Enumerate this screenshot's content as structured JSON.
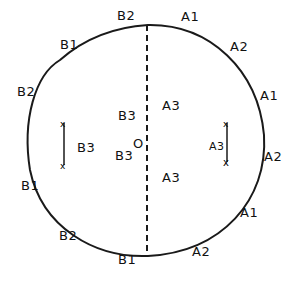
{
  "diagram": {
    "type": "hand-drawn circle with dashed vertical diameter",
    "center_label": "O",
    "left_half_boundary_labels": [
      "B2",
      "B1",
      "B2",
      "B1",
      "B2",
      "B1"
    ],
    "right_half_boundary_labels": [
      "A1",
      "A2",
      "A1",
      "A2",
      "A1",
      "A2"
    ],
    "interior_labels": {
      "left_upper": "B3",
      "left_lower": "B3",
      "right_upper": "A3",
      "right_lower": "A3",
      "left_segment": "B3",
      "right_segment": "A3"
    },
    "labels": [
      {
        "text": "B2",
        "x": 117,
        "y": 15
      },
      {
        "text": "B1",
        "x": 60,
        "y": 44
      },
      {
        "text": "B2",
        "x": 17,
        "y": 91
      },
      {
        "text": "B3",
        "x": 77,
        "y": 147
      },
      {
        "text": "B1",
        "x": 21,
        "y": 185
      },
      {
        "text": "B2",
        "x": 59,
        "y": 235
      },
      {
        "text": "B1",
        "x": 118,
        "y": 259
      },
      {
        "text": "A1",
        "x": 181,
        "y": 16
      },
      {
        "text": "A2",
        "x": 230,
        "y": 46
      },
      {
        "text": "A1",
        "x": 260,
        "y": 95
      },
      {
        "text": "A3",
        "x": 209,
        "y": 147
      },
      {
        "text": "A2",
        "x": 264,
        "y": 156
      },
      {
        "text": "A1",
        "x": 240,
        "y": 212
      },
      {
        "text": "A2",
        "x": 192,
        "y": 251
      },
      {
        "text": "B3",
        "x": 118,
        "y": 115
      },
      {
        "text": "B3",
        "x": 115,
        "y": 155
      },
      {
        "text": "A3",
        "x": 162,
        "y": 105
      },
      {
        "text": "A3",
        "x": 162,
        "y": 177
      },
      {
        "text": "O",
        "x": 133,
        "y": 143
      }
    ]
  }
}
